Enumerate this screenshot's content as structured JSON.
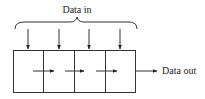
{
  "diagram": {
    "input_label": "Data in",
    "output_label": "Data out",
    "cells": 4,
    "colors": {
      "stroke": "#333333",
      "text": "#222222",
      "background": "#ffffff"
    }
  }
}
